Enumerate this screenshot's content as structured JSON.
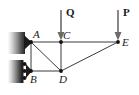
{
  "figure": {
    "width": 139,
    "height": 95,
    "background_color": "#ffffff",
    "member_color": "#3a3a3a",
    "arrow_color": "#6b6b6b",
    "support_color": "#1b1b1b",
    "label_color": "#1a1a1a"
  },
  "nodes": [
    {
      "id": "A",
      "label": "A",
      "x": 31,
      "y": 42,
      "label_x": 33,
      "label_y": 38
    },
    {
      "id": "B",
      "label": "B",
      "x": 31,
      "y": 71,
      "label_x": 30,
      "label_y": 83
    },
    {
      "id": "C",
      "label": "C",
      "x": 61,
      "y": 42,
      "label_x": 63,
      "label_y": 39
    },
    {
      "id": "D",
      "label": "D",
      "x": 61,
      "y": 71,
      "label_x": 59,
      "label_y": 83
    },
    {
      "id": "E",
      "label": "E",
      "x": 118,
      "y": 42,
      "label_x": 122,
      "label_y": 46
    }
  ],
  "members": [
    {
      "from": "A",
      "to": "C"
    },
    {
      "from": "C",
      "to": "E"
    },
    {
      "from": "A",
      "to": "B"
    },
    {
      "from": "B",
      "to": "D"
    },
    {
      "from": "A",
      "to": "D"
    },
    {
      "from": "C",
      "to": "D"
    },
    {
      "from": "D",
      "to": "E"
    }
  ],
  "loads": [
    {
      "id": "Q",
      "label": "Q",
      "at_node": "C",
      "direction": "down",
      "x": 61,
      "y_top": 10,
      "y_tip": 40,
      "label_x": 66,
      "label_y": 15
    },
    {
      "id": "P",
      "label": "P",
      "at_node": "E",
      "direction": "down",
      "x": 118,
      "y_top": 10,
      "y_tip": 40,
      "label_x": 123,
      "label_y": 15
    }
  ],
  "supports": [
    {
      "id": "support-A",
      "type": "pin",
      "at_node": "A",
      "wall_x": 8,
      "wall_y": 32,
      "wall_width": 17,
      "wall_height": 22
    },
    {
      "id": "support-B",
      "type": "roller",
      "at_node": "B",
      "wall_x": 8,
      "wall_y": 60,
      "wall_width": 14,
      "wall_height": 23,
      "roller_count": 3
    }
  ]
}
